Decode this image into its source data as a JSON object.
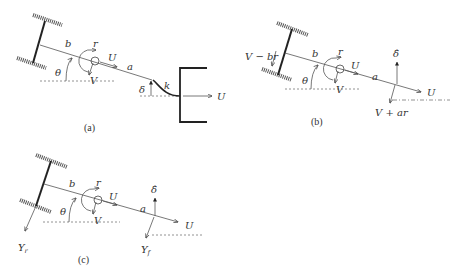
{
  "figure": {
    "panels": [
      {
        "id": "a",
        "caption": "(a)",
        "labels": {
          "b": "b",
          "a": "a",
          "r": "r",
          "U": "U",
          "V": "V",
          "theta": "θ",
          "delta": "δ",
          "k": "k",
          "U_trailer": "U"
        }
      },
      {
        "id": "b",
        "caption": "(b)",
        "labels": {
          "b": "b",
          "a": "a",
          "r": "r",
          "U": "U",
          "V": "V",
          "theta": "θ",
          "delta_hat": "δ̂",
          "U_front": "U",
          "rear_velocity": "V − br",
          "front_velocity": "V + ar"
        }
      },
      {
        "id": "c",
        "caption": "(c)",
        "labels": {
          "b": "b",
          "a": "a",
          "r": "r",
          "U": "U",
          "V": "V",
          "theta": "θ",
          "delta_hat": "δ̂",
          "U_front": "U",
          "Y_main": "Y",
          "Y_r_sub": "r",
          "Yf_main": "Y",
          "Y_f_sub": "f"
        }
      }
    ]
  }
}
